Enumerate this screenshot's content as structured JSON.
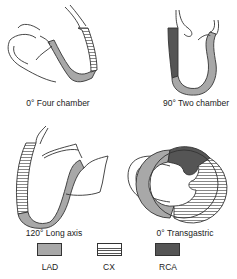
{
  "views": [
    {
      "id": "four-chamber",
      "label": "0° Four chamber"
    },
    {
      "id": "two-chamber",
      "label": "90° Two chamber"
    },
    {
      "id": "long-axis",
      "label": "120° Long axis"
    },
    {
      "id": "transgastric",
      "label": "0° Transgastric"
    }
  ],
  "legend": [
    {
      "label": "LAD",
      "pattern": "solid-light-gray",
      "color": "#a8a8a8"
    },
    {
      "label": "CX",
      "pattern": "horizontal-stripes",
      "color": "#ffffff"
    },
    {
      "label": "RCA",
      "pattern": "solid-dark-gray",
      "color": "#555555"
    }
  ],
  "colors": {
    "lad": "#a8a8a8",
    "cx_stripe": "#555555",
    "rca": "#555555",
    "outline": "#333333"
  }
}
